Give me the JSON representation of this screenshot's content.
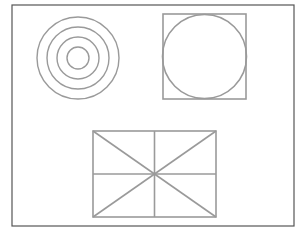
{
  "diagram": {
    "frame": {
      "x": 12,
      "y": 5,
      "width": 282,
      "height": 221,
      "stroke": "#555555",
      "stroke_width": 1.2
    },
    "shape_stroke": "#9a9a9a",
    "concentric_circles": {
      "cx": 78,
      "cy": 58,
      "radii": [
        41,
        31,
        21,
        11
      ],
      "stroke_width": 1.4
    },
    "square_with_circle": {
      "x": 163,
      "y": 14,
      "width": 83,
      "height": 85,
      "circle": {
        "cx": 204.5,
        "cy": 56.5,
        "r": 42
      },
      "stroke_width": 1.6
    },
    "divided_rectangle": {
      "x": 93,
      "y": 131,
      "width": 123,
      "height": 86,
      "stroke_width": 1.6
    }
  }
}
